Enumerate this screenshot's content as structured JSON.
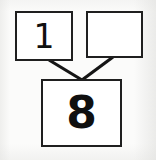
{
  "document": {
    "kind": "number-bond-worksheet-scan",
    "background_color": "#fbfbfa",
    "ink_color": "#1f1f1f"
  },
  "diagram": {
    "type": "number-bond",
    "title": "",
    "parts": [
      {
        "id": "part-left",
        "label": "1",
        "role": "part",
        "filled": true,
        "box": {
          "x": 15,
          "y": 11,
          "width": 58,
          "height": 50
        }
      },
      {
        "id": "part-right",
        "label": "",
        "role": "part",
        "filled": false,
        "box": {
          "x": 86,
          "y": 11,
          "width": 57,
          "height": 47
        }
      }
    ],
    "whole": {
      "id": "whole-bottom",
      "label": "8",
      "role": "whole",
      "filled": true,
      "box": {
        "x": 41,
        "y": 79,
        "width": 81,
        "height": 68
      }
    },
    "connectors": [
      {
        "id": "connector-left",
        "from": "part-left",
        "to": "whole-bottom",
        "x1": 49,
        "y1": 60,
        "x2": 82,
        "y2": 80
      },
      {
        "id": "connector-right",
        "from": "part-right",
        "to": "whole-bottom",
        "x1": 113,
        "y1": 57,
        "x2": 82,
        "y2": 80
      }
    ]
  }
}
